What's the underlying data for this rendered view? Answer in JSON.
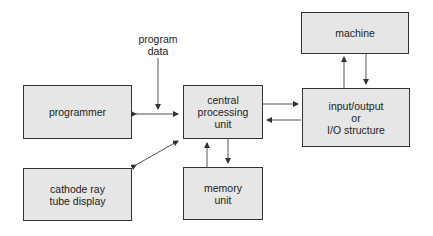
{
  "blocks": {
    "programmer": "programmer",
    "cpu": "central\nprocessing\nunit",
    "machine": "machine",
    "io": "input/output\nor\nI/O structure",
    "memory": "memory\nunit",
    "crt": "cathode ray\ntube display"
  },
  "annotations": {
    "program_data": "program\ndata"
  },
  "connections": [
    {
      "from": "programmer",
      "to": "cpu",
      "type": "bidirectional"
    },
    {
      "from": "program_data",
      "to": "programmer-cpu link",
      "type": "unidirectional"
    },
    {
      "from": "crt",
      "to": "cpu",
      "type": "bidirectional"
    },
    {
      "from": "cpu",
      "to": "io",
      "type": "unidirectional"
    },
    {
      "from": "io",
      "to": "cpu",
      "type": "unidirectional"
    },
    {
      "from": "io",
      "to": "machine",
      "type": "unidirectional"
    },
    {
      "from": "machine",
      "to": "io",
      "type": "unidirectional"
    },
    {
      "from": "memory",
      "to": "cpu",
      "type": "unidirectional"
    },
    {
      "from": "cpu",
      "to": "memory",
      "type": "unidirectional"
    }
  ],
  "colors": {
    "box_fill": "#e6e6e6",
    "box_border": "#333333",
    "line": "#444444"
  }
}
